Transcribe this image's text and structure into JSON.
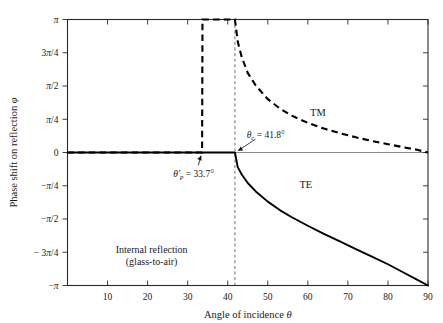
{
  "chart_data": {
    "type": "line",
    "title": "",
    "xlabel": "Angle of incidence θ",
    "ylabel": "Phase shift on reflection φ",
    "xlim": [
      0,
      90
    ],
    "ylim": [
      -3.141592653589793,
      3.141592653589793
    ],
    "grid": false,
    "legend_position": "inline-curve-labels",
    "xticks": [
      10,
      20,
      30,
      40,
      50,
      60,
      70,
      80,
      90
    ],
    "xtick_labels": [
      "10",
      "20",
      "30",
      "40",
      "50",
      "60",
      "70",
      "80",
      "90"
    ],
    "yticks": [
      3.14159,
      2.35619,
      1.5708,
      0.7854,
      0,
      -0.7854,
      -1.5708,
      -2.35619,
      -3.14159
    ],
    "ytick_labels": [
      "π",
      "3π/4",
      "π/2",
      "π/4",
      "0",
      "−π/4",
      "−π/2",
      "− 3π/4",
      "−π"
    ],
    "series": [
      {
        "name": "TM",
        "style": "dashed",
        "label": "TM",
        "label_x": 62.5,
        "label_y": 0.86,
        "x": [
          0,
          5,
          10,
          15,
          20,
          25,
          30,
          33.6,
          33.7,
          36,
          38,
          40,
          41.7,
          41.8,
          42.5,
          43.5,
          45,
          47,
          50,
          53,
          56,
          60,
          64,
          68,
          72,
          76,
          80,
          84,
          87,
          90
        ],
        "y": [
          0,
          0,
          0,
          0,
          0,
          0,
          0,
          0,
          3.14159,
          3.14159,
          3.14159,
          3.14159,
          3.14159,
          3.14159,
          2.62,
          2.25,
          1.88,
          1.58,
          1.26,
          1.04,
          0.87,
          0.7,
          0.565,
          0.455,
          0.358,
          0.272,
          0.196,
          0.122,
          0.069,
          0
        ]
      },
      {
        "name": "TE",
        "style": "solid",
        "label": "TE",
        "label_x": 59.5,
        "label_y": -0.83,
        "x": [
          0,
          10,
          20,
          30,
          38,
          41.8,
          42.5,
          43.5,
          45,
          47,
          50,
          53,
          56,
          60,
          64,
          68,
          72,
          76,
          80,
          84,
          87,
          90
        ],
        "y": [
          0,
          0,
          0,
          0,
          0,
          0,
          -0.345,
          -0.52,
          -0.72,
          -0.92,
          -1.16,
          -1.36,
          -1.53,
          -1.73,
          -1.92,
          -2.1,
          -2.28,
          -2.46,
          -2.64,
          -2.84,
          -2.99,
          -3.14159
        ]
      }
    ],
    "annotations": [
      {
        "name": "brewster-internal-angle",
        "text": "θ′p = 33.7°",
        "math": {
          "symbol": "θ",
          "prime": "′",
          "subscript": "p",
          "equals": "=",
          "value": "33.7°"
        },
        "point_x": 33.7,
        "point_y": 0,
        "label_x": 31.5,
        "label_y": -0.5
      },
      {
        "name": "critical-angle",
        "text": "θc = 41.8°",
        "math": {
          "symbol": "θ",
          "prime": "",
          "subscript": "c",
          "equals": "=",
          "value": "41.8°"
        },
        "point_x": 41.8,
        "point_y": 0,
        "label_x": 49.5,
        "label_y": 0.42
      }
    ],
    "vertical_reference_lines": [
      {
        "name": "critical-angle-guide",
        "x": 41.8,
        "style": "dashed"
      }
    ],
    "notes": [
      {
        "name": "reflection-condition-note",
        "line1": "Internal reflection",
        "line2": "(glass-to-air)",
        "x": 21,
        "y": -2.38
      }
    ]
  },
  "colors": {
    "curve": "#000000",
    "axis": "#2a2a2a",
    "guide": "#333333",
    "text": "#1a1a1a",
    "background": "#ffffff"
  }
}
